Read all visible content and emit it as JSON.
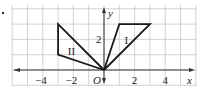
{
  "figure": {
    "bullet": "•",
    "axes": {
      "x_label": "x",
      "y_label": "y",
      "origin_label": "O",
      "x_ticks": [
        {
          "value": -4,
          "label": "−4"
        },
        {
          "value": -2,
          "label": "−2"
        },
        {
          "value": 2,
          "label": "2"
        },
        {
          "value": 4,
          "label": "4"
        }
      ],
      "y_ticks": [
        {
          "value": 2,
          "label": "2"
        }
      ]
    },
    "grid": {
      "x_min": -6,
      "x_max": 6,
      "y_min": -1,
      "y_max": 4,
      "step": 1
    },
    "shapes": [
      {
        "label": "I",
        "vertices": [
          [
            0,
            0
          ],
          [
            1,
            3
          ],
          [
            3,
            3
          ]
        ]
      },
      {
        "label": "II",
        "vertices": [
          [
            0,
            0
          ],
          [
            -3,
            3
          ],
          [
            -3,
            1
          ]
        ]
      }
    ]
  }
}
